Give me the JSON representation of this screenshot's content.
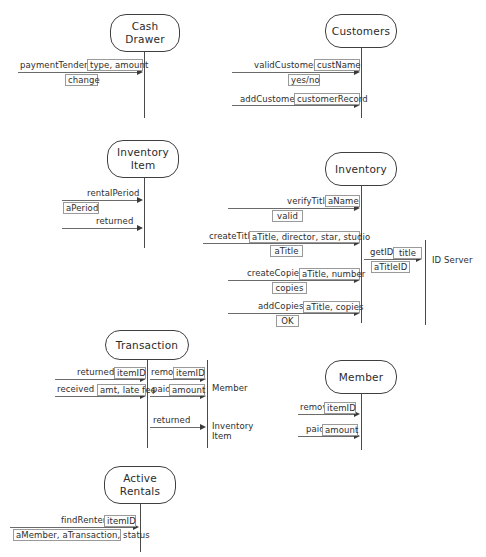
{
  "diagram": {
    "background_color": "#ffffff",
    "line_color": "#6b6b6b",
    "capsule_border_color": "#3f3f3f",
    "box_border_color": "#9a9a9a"
  },
  "objects": [
    {
      "id": "cash_drawer",
      "label": "Cash\nDrawer"
    },
    {
      "id": "customers",
      "label": "Customers"
    },
    {
      "id": "inventory_item",
      "label": "Inventory\nItem"
    },
    {
      "id": "inventory",
      "label": "Inventory"
    },
    {
      "id": "transaction",
      "label": "Transaction"
    },
    {
      "id": "member",
      "label": "Member"
    },
    {
      "id": "active_rentals",
      "label": "Active\nRentals"
    }
  ],
  "side_labels": [
    {
      "id": "id_server",
      "text": "ID Server"
    },
    {
      "id": "member_side",
      "text": "Member"
    },
    {
      "id": "inventory_item_side",
      "text": "Inventory\nItem"
    }
  ],
  "messages": [
    {
      "id": "m1",
      "target": "cash_drawer",
      "name": "paymentTendered",
      "params": "type, amount",
      "ret": "change"
    },
    {
      "id": "m2",
      "target": "customers",
      "name": "validCustomer",
      "params": "custName",
      "ret": "yes/no"
    },
    {
      "id": "m3",
      "target": "customers",
      "name": "addCustomer",
      "params": "customerRecord",
      "ret": ""
    },
    {
      "id": "m4",
      "target": "inventory_item",
      "name": "rentalPeriod",
      "params": "",
      "ret": "aPeriod"
    },
    {
      "id": "m5",
      "target": "inventory_item",
      "name": "returned",
      "params": "",
      "ret": ""
    },
    {
      "id": "m6",
      "target": "inventory",
      "name": "verifyTitle",
      "params": "aName",
      "ret": "valid"
    },
    {
      "id": "m7",
      "target": "inventory",
      "name": "createTitle",
      "params": "aTitle, director, star, studio",
      "ret": "aTitle"
    },
    {
      "id": "m8",
      "target": "id_server",
      "name": "getID",
      "params": "title",
      "ret": "aTitleID"
    },
    {
      "id": "m9",
      "target": "inventory",
      "name": "createCopies",
      "params": "aTitle, number",
      "ret": "copies"
    },
    {
      "id": "m10",
      "target": "inventory",
      "name": "addCopies",
      "params": "aTitle, copies",
      "ret": "OK"
    },
    {
      "id": "m11",
      "target": "transaction",
      "name": "returned",
      "params": "itemID",
      "ret": ""
    },
    {
      "id": "m12",
      "target": "transaction",
      "name": "received",
      "params": "amt, late fee",
      "ret": ""
    },
    {
      "id": "m13",
      "target": "member_side",
      "name": "remove",
      "params": "itemID",
      "ret": ""
    },
    {
      "id": "m14",
      "target": "member_side",
      "name": "paid",
      "params": "amount",
      "ret": ""
    },
    {
      "id": "m15",
      "target": "inventory_item_side",
      "name": "returned",
      "params": "",
      "ret": ""
    },
    {
      "id": "m16",
      "target": "member",
      "name": "remove",
      "params": "itemID",
      "ret": ""
    },
    {
      "id": "m17",
      "target": "member",
      "name": "paid",
      "params": "amount",
      "ret": ""
    },
    {
      "id": "m18",
      "target": "active_rentals",
      "name": "findRenter",
      "params": "itemID",
      "ret": "aMember, aTransaction, status"
    }
  ],
  "text": {
    "cash_drawer": "Cash\nDrawer",
    "customers": "Customers",
    "inventory_item": "Inventory\nItem",
    "inventory": "Inventory",
    "transaction": "Transaction",
    "member": "Member",
    "active_rentals": "Active\nRentals",
    "id_server": "ID Server",
    "member_side": "Member",
    "inventory_item_side": "Inventory\nItem",
    "paymentTendered": "paymentTendered",
    "type_amount": "type, amount",
    "change": "change",
    "validCustomer": "validCustomer",
    "custName": "custName",
    "yes_no": "yes/no",
    "addCustomer": "addCustomer",
    "customerRecord": "customerRecord",
    "rentalPeriod": "rentalPeriod",
    "aPeriod": "aPeriod",
    "returned1": "returned",
    "verifyTitle": "verifyTitle",
    "aName": "aName",
    "valid": "valid",
    "createTitle": "createTitle",
    "createTitle_params": "aTitle, director, star, studio",
    "aTitle": "aTitle",
    "getID": "getID",
    "title": "title",
    "aTitleID": "aTitleID",
    "createCopies": "createCopies",
    "createCopies_params": "aTitle, number",
    "copies": "copies",
    "addCopies": "addCopies",
    "addCopies_params": "aTitle, copies",
    "ok": "OK",
    "returned2": "returned",
    "itemID1": "itemID",
    "received": "received",
    "amt_latefee": "amt, late fee",
    "remove1": "remove",
    "itemID2": "itemID",
    "paid1": "paid",
    "amount1": "amount",
    "returned3": "returned",
    "remove2": "remove",
    "itemID3": "itemID",
    "paid2": "paid",
    "amount2": "amount",
    "findRenter": "findRenter",
    "itemID4": "itemID",
    "aMember_aTransaction_status": "aMember, aTransaction, status"
  }
}
